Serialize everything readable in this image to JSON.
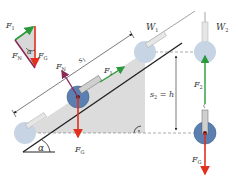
{
  "diagram": {
    "colors": {
      "gravity": "#e0301e",
      "pull": "#2a9a3a",
      "normal": "#8a2a5a",
      "ramp": "#dcdcdc",
      "wheel": "#5a7fb0",
      "wheel_faded": "#c6d4e4",
      "line": "#222222",
      "dashed": "#888888"
    },
    "vector_triangle": {
      "F1": "F",
      "F1_sub": "1",
      "FN": "F",
      "FN_sub": "N",
      "FG": "F",
      "FG_sub": "G",
      "angle": "α"
    },
    "incline": {
      "s1": "s",
      "s1_sub": "1",
      "FN": "F",
      "FN_sub": "N",
      "F1": "F",
      "F1_sub": "1",
      "FG": "F",
      "FG_sub": "G",
      "angle": "α",
      "W1": "W",
      "W1_sub": "1"
    },
    "vertical": {
      "s2_label": "s",
      "s2_sub": "2",
      "s2_eq": "= h",
      "W2": "W",
      "W2_sub": "2",
      "F2": "F",
      "F2_sub": "2",
      "FG": "F",
      "FG_sub": "G"
    }
  }
}
